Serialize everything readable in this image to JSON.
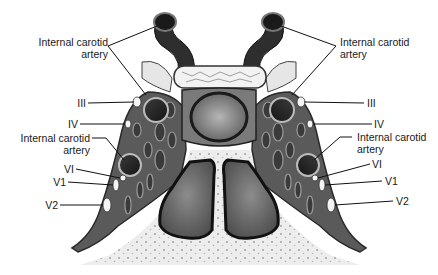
{
  "figure": {
    "colors": {
      "bone_fill": "#ececec",
      "bone_pore": "#9a9a9a",
      "dura": "#7a7a7a",
      "sinus_fill": "#555555",
      "artery": "#1e1e1e",
      "pituitary": "#8a8a8a",
      "sphenoid_sinus": "#6e6e6e",
      "nerve": "#f4f4f4",
      "leader_line": "#111111"
    }
  },
  "labels": {
    "left": {
      "ica_top_line1": "Internal carotid",
      "ica_top_line2": "artery",
      "iii": "III",
      "iv": "IV",
      "ica_mid_line1": "Internal carotid",
      "ica_mid_line2": "artery",
      "vi": "VI",
      "v1": "V1",
      "v2": "V2"
    },
    "right": {
      "ica_top_line1": "Internal carotid",
      "ica_top_line2": "artery",
      "iii": "III",
      "iv": "IV",
      "ica_mid_line1": "Internal carotid",
      "ica_mid_line2": "artery",
      "vi": "VI",
      "v1": "V1",
      "v2": "V2"
    }
  }
}
